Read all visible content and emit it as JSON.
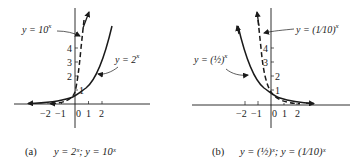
{
  "panels": [
    {
      "id": "a",
      "caption_tag": "(a)",
      "caption_text": "y = 2ˣ;  y = 10ˣ",
      "labels": {
        "solid": "y = 2",
        "solid_exp": "x",
        "dashed": "y = 10",
        "dashed_exp": "x"
      },
      "x_ticks": [
        "−2",
        "−1",
        "0",
        "1",
        "2"
      ],
      "y_ticks": [
        "1",
        "2",
        "3",
        "4"
      ]
    },
    {
      "id": "b",
      "caption_tag": "(b)",
      "caption_text": "y = (½)ˣ;  y = (1⁄10)ˣ",
      "labels": {
        "solid": "y = (½)",
        "solid_exp": "x",
        "dashed": "y = (1⁄10)",
        "dashed_exp": "x"
      },
      "x_ticks": [
        "−2",
        "−1",
        "0",
        "1",
        "2"
      ],
      "y_ticks": [
        "1",
        "2",
        "3",
        "4"
      ]
    }
  ],
  "colors": {
    "ink": "#1a1a1a",
    "background": "#ffffff"
  }
}
